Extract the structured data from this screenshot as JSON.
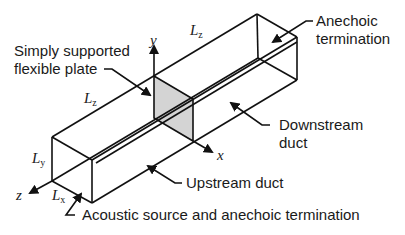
{
  "diagram": {
    "labels": {
      "plate": [
        "Simply supported",
        "flexible plate"
      ],
      "anechoic": [
        "Anechoic",
        "termination"
      ],
      "downstream": [
        "Downstream",
        "duct"
      ],
      "upstream": "Upstream duct",
      "source": "Acoustic source and anechoic termination"
    },
    "dimensions": {
      "lz_top": {
        "sym": "L",
        "sub": "z"
      },
      "lz_left": {
        "sym": "L",
        "sub": "z"
      },
      "ly": {
        "sym": "L",
        "sub": "y"
      },
      "lx": {
        "sym": "L",
        "sub": "x"
      }
    },
    "axes": {
      "x": "x",
      "y": "y",
      "z": "z"
    },
    "colors": {
      "line": "#111111",
      "plate_fill": "#d4d4d4"
    }
  }
}
